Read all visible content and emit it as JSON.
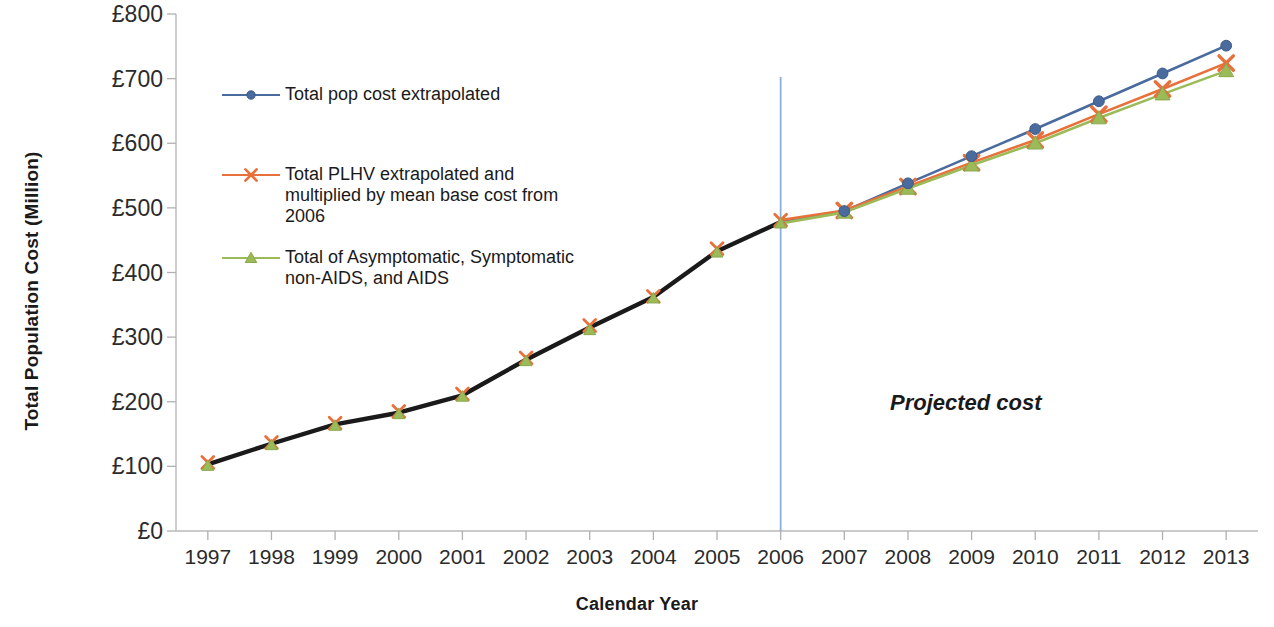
{
  "chart_data": {
    "type": "line",
    "title": "",
    "xlabel": "Calendar Year",
    "ylabel": "Total Population Cost (Million)",
    "x": [
      1997,
      1998,
      1999,
      2000,
      2001,
      2002,
      2003,
      2004,
      2005,
      2006,
      2007,
      2008,
      2009,
      2010,
      2011,
      2012,
      2013
    ],
    "categories": [
      "1997",
      "1998",
      "1999",
      "2000",
      "2001",
      "2002",
      "2003",
      "2004",
      "2005",
      "2006",
      "2007",
      "2008",
      "2009",
      "2010",
      "2011",
      "2012",
      "2013"
    ],
    "xlim": [
      1996.5,
      2013.5
    ],
    "ylim": [
      0,
      800
    ],
    "yticks": [
      0,
      100,
      200,
      300,
      400,
      500,
      600,
      700,
      800
    ],
    "ytick_labels": [
      "£0",
      "£100",
      "£200",
      "£300",
      "£400",
      "£500",
      "£600",
      "£700",
      "£800"
    ],
    "grid": false,
    "legend_position": "upper-left-inside",
    "series": [
      {
        "name": "Total pop cost extrapolated",
        "color": "#4a6b9e",
        "marker": "circle",
        "values": [
          103,
          135,
          165,
          183,
          210,
          265,
          315,
          362,
          433,
          478,
          495,
          538,
          580,
          622,
          665,
          708,
          751
        ]
      },
      {
        "name": "Total PLHV extrapolated and multiplied by mean base cost from 2006",
        "color": "#e8703a",
        "marker": "x",
        "values": [
          106,
          137,
          167,
          185,
          212,
          268,
          318,
          363,
          437,
          481,
          496,
          533,
          570,
          605,
          645,
          684,
          724
        ]
      },
      {
        "name": "Total of Asymptomatic, Symptomatic non-AIDS, and AIDS",
        "color": "#9bbb59",
        "marker": "triangle",
        "values": [
          101,
          133,
          163,
          181,
          208,
          263,
          311,
          360,
          431,
          476,
          493,
          530,
          566,
          600,
          639,
          676,
          712
        ]
      }
    ],
    "historical_overlay": {
      "color": "#1a1a1a",
      "through_year": 2006,
      "description": "overlapping series drawn as single dark line up to 2006"
    },
    "annotations": [
      {
        "text": "Projected cost",
        "x": 2009.6,
        "y": 200,
        "style": "bold-italic"
      }
    ],
    "reference_lines": [
      {
        "orientation": "vertical",
        "x": 2006,
        "color": "#8ab0dd",
        "label": ""
      }
    ]
  },
  "legend": {
    "entries": [
      {
        "label": "Total pop cost extrapolated"
      },
      {
        "label": "Total PLHV extrapolated and\nmultiplied by mean base cost from\n2006"
      },
      {
        "label": "Total of Asymptomatic, Symptomatic\nnon-AIDS, and AIDS"
      }
    ]
  }
}
